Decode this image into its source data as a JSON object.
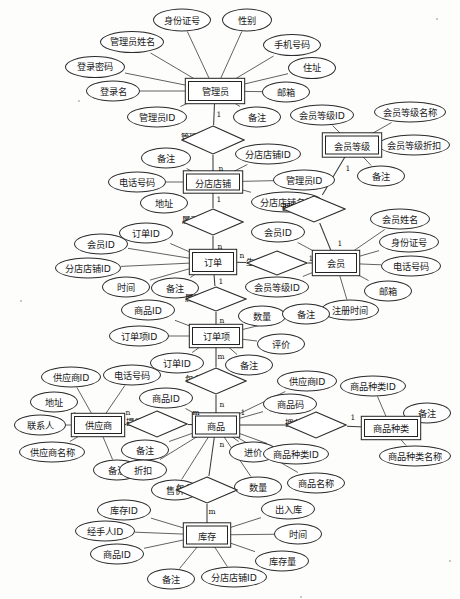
{
  "diagram": {
    "type": "entity-relationship",
    "style": {
      "stroke": "#2b2b2b",
      "fill": "#ffffff",
      "text": "#1a1a1a"
    }
  },
  "entities": [
    {
      "id": "admin",
      "label": "管理员",
      "x": 215,
      "y": 91,
      "w": 54,
      "h": 20
    },
    {
      "id": "branch",
      "label": "分店店铺",
      "x": 213,
      "y": 182,
      "w": 54,
      "h": 17
    },
    {
      "id": "level",
      "label": "会员等级",
      "x": 352,
      "y": 145,
      "w": 54,
      "h": 19
    },
    {
      "id": "order",
      "label": "订单",
      "x": 213,
      "y": 262,
      "w": 42,
      "h": 20
    },
    {
      "id": "member",
      "label": "会员",
      "x": 336,
      "y": 263,
      "w": 42,
      "h": 20
    },
    {
      "id": "orderitem",
      "label": "订单项",
      "x": 216,
      "y": 336,
      "w": 48,
      "h": 18
    },
    {
      "id": "supplier",
      "label": "供应商",
      "x": 98,
      "y": 425,
      "w": 48,
      "h": 18
    },
    {
      "id": "goods",
      "label": "商品",
      "x": 216,
      "y": 425,
      "w": 42,
      "h": 19
    },
    {
      "id": "category",
      "label": "商品种类",
      "x": 391,
      "y": 428,
      "w": 54,
      "h": 18
    },
    {
      "id": "stock",
      "label": "库存",
      "x": 207,
      "y": 535,
      "w": 42,
      "h": 19
    }
  ],
  "relationships": [
    {
      "id": "rel-manage",
      "label": "管理",
      "x": 213,
      "y": 140,
      "w": 64,
      "h": 30
    },
    {
      "id": "rel-belong-shop",
      "label": "属于",
      "x": 213,
      "y": 222,
      "w": 62,
      "h": 28
    },
    {
      "id": "rel-own-level",
      "label": "拥有",
      "x": 314,
      "y": 209,
      "w": 64,
      "h": 28
    },
    {
      "id": "rel-generate",
      "label": "生成",
      "x": 277,
      "y": 263,
      "w": 62,
      "h": 26
    },
    {
      "id": "rel-belong-order",
      "label": "属于",
      "x": 216,
      "y": 299,
      "w": 62,
      "h": 26
    },
    {
      "id": "rel-contain-item",
      "label": "包含",
      "x": 216,
      "y": 381,
      "w": 62,
      "h": 28
    },
    {
      "id": "rel-supply",
      "label": "提供",
      "x": 157,
      "y": 424,
      "w": 62,
      "h": 28
    },
    {
      "id": "rel-own-cat",
      "label": "拥有",
      "x": 316,
      "y": 425,
      "w": 62,
      "h": 28
    },
    {
      "id": "rel-contain-stk",
      "label": "包含",
      "x": 207,
      "y": 490,
      "w": 62,
      "h": 28
    }
  ],
  "attributes": [
    {
      "id": "a1",
      "label": "身份证号",
      "owner": "admin",
      "x": 182,
      "y": 20,
      "w": 58,
      "h": 23
    },
    {
      "id": "a2",
      "label": "性别",
      "owner": "admin",
      "x": 247,
      "y": 20,
      "w": 50,
      "h": 23
    },
    {
      "id": "a3",
      "label": "管理员姓名",
      "owner": "admin",
      "x": 132,
      "y": 42,
      "w": 64,
      "h": 22
    },
    {
      "id": "a4",
      "label": "手机号码",
      "owner": "admin",
      "x": 292,
      "y": 45,
      "w": 58,
      "h": 22
    },
    {
      "id": "a5",
      "label": "住址",
      "owner": "admin",
      "x": 312,
      "y": 68,
      "w": 48,
      "h": 22
    },
    {
      "id": "a6",
      "label": "登录密码",
      "owner": "admin",
      "x": 95,
      "y": 67,
      "w": 60,
      "h": 22
    },
    {
      "id": "a7",
      "label": "登录名",
      "owner": "admin",
      "x": 113,
      "y": 91,
      "w": 54,
      "h": 21
    },
    {
      "id": "a8",
      "label": "邮箱",
      "owner": "admin",
      "x": 286,
      "y": 92,
      "w": 48,
      "h": 21
    },
    {
      "id": "a9",
      "label": "管理员ID",
      "owner": "admin",
      "x": 157,
      "y": 117,
      "w": 60,
      "h": 21
    },
    {
      "id": "a10",
      "label": "备注",
      "owner": "admin",
      "x": 257,
      "y": 117,
      "w": 48,
      "h": 21
    },
    {
      "id": "a11",
      "label": "会员等级ID",
      "owner": "level",
      "x": 322,
      "y": 115,
      "w": 64,
      "h": 21
    },
    {
      "id": "a12",
      "label": "会员等级名称",
      "owner": "level",
      "x": 410,
      "y": 112,
      "w": 72,
      "h": 21
    },
    {
      "id": "a13",
      "label": "会员等级折扣",
      "owner": "level",
      "x": 414,
      "y": 145,
      "w": 72,
      "h": 21
    },
    {
      "id": "a14",
      "label": "备注",
      "owner": "level",
      "x": 381,
      "y": 176,
      "w": 48,
      "h": 21
    },
    {
      "id": "a15",
      "label": "备注",
      "owner": "branch",
      "x": 166,
      "y": 158,
      "w": 50,
      "h": 21
    },
    {
      "id": "a16",
      "label": "分店店铺ID",
      "owner": "branch",
      "x": 268,
      "y": 154,
      "w": 66,
      "h": 21
    },
    {
      "id": "a17",
      "label": "电话号码",
      "owner": "branch",
      "x": 137,
      "y": 182,
      "w": 58,
      "h": 21
    },
    {
      "id": "a18",
      "label": "管理员ID",
      "owner": "branch",
      "x": 304,
      "y": 180,
      "w": 62,
      "h": 21
    },
    {
      "id": "a19",
      "label": "地址",
      "owner": "branch",
      "x": 164,
      "y": 203,
      "w": 48,
      "h": 21
    },
    {
      "id": "a20",
      "label": "分店店铺名称",
      "owner": "branch",
      "x": 287,
      "y": 202,
      "w": 72,
      "h": 21
    },
    {
      "id": "a21",
      "label": "订单ID",
      "owner": "order",
      "x": 146,
      "y": 233,
      "w": 54,
      "h": 21
    },
    {
      "id": "a22",
      "label": "会员ID",
      "owner": "order",
      "x": 101,
      "y": 244,
      "w": 54,
      "h": 21
    },
    {
      "id": "a23",
      "label": "分店店铺ID",
      "owner": "order",
      "x": 88,
      "y": 268,
      "w": 66,
      "h": 21
    },
    {
      "id": "a24",
      "label": "时间",
      "owner": "order",
      "x": 126,
      "y": 287,
      "w": 48,
      "h": 21
    },
    {
      "id": "a25",
      "label": "备注",
      "owner": "order",
      "x": 175,
      "y": 288,
      "w": 48,
      "h": 21
    },
    {
      "id": "a26",
      "label": "会员ID",
      "owner": "member",
      "x": 278,
      "y": 232,
      "w": 54,
      "h": 21
    },
    {
      "id": "a27",
      "label": "会员等级ID",
      "owner": "member",
      "x": 277,
      "y": 287,
      "w": 64,
      "h": 21
    },
    {
      "id": "a28",
      "label": "会员姓名",
      "owner": "member",
      "x": 400,
      "y": 219,
      "w": 60,
      "h": 21
    },
    {
      "id": "a29",
      "label": "身份证号",
      "owner": "member",
      "x": 409,
      "y": 242,
      "w": 60,
      "h": 21
    },
    {
      "id": "a30",
      "label": "电话号码",
      "owner": "member",
      "x": 411,
      "y": 266,
      "w": 60,
      "h": 21
    },
    {
      "id": "a31",
      "label": "邮箱",
      "owner": "member",
      "x": 388,
      "y": 291,
      "w": 48,
      "h": 21
    },
    {
      "id": "a32",
      "label": "注册时间",
      "owner": "member",
      "x": 350,
      "y": 310,
      "w": 58,
      "h": 21
    },
    {
      "id": "a33",
      "label": "商品ID",
      "owner": "orderitem",
      "x": 148,
      "y": 310,
      "w": 54,
      "h": 21
    },
    {
      "id": "a34",
      "label": "订单项ID",
      "owner": "orderitem",
      "x": 139,
      "y": 336,
      "w": 60,
      "h": 21
    },
    {
      "id": "a35",
      "label": "数量",
      "owner": "orderitem",
      "x": 262,
      "y": 316,
      "w": 48,
      "h": 21
    },
    {
      "id": "a36",
      "label": "备注",
      "owner": "orderitem",
      "x": 306,
      "y": 314,
      "w": 48,
      "h": 21
    },
    {
      "id": "a37",
      "label": "评价",
      "owner": "orderitem",
      "x": 281,
      "y": 344,
      "w": 48,
      "h": 21
    },
    {
      "id": "a38",
      "label": "订单ID",
      "owner": "orderitem",
      "x": 177,
      "y": 363,
      "w": 54,
      "h": 21
    },
    {
      "id": "a39",
      "label": "备注",
      "owner": "orderitem",
      "x": 249,
      "y": 365,
      "w": 48,
      "h": 21
    },
    {
      "id": "a40",
      "label": "供应商ID",
      "owner": "supplier",
      "x": 71,
      "y": 377,
      "w": 60,
      "h": 21
    },
    {
      "id": "a41",
      "label": "电话号码",
      "owner": "supplier",
      "x": 132,
      "y": 375,
      "w": 58,
      "h": 21
    },
    {
      "id": "a42",
      "label": "地址",
      "owner": "supplier",
      "x": 54,
      "y": 402,
      "w": 48,
      "h": 21
    },
    {
      "id": "a43",
      "label": "联系人",
      "owner": "supplier",
      "x": 40,
      "y": 425,
      "w": 52,
      "h": 21
    },
    {
      "id": "a44",
      "label": "供应商名称",
      "owner": "supplier",
      "x": 52,
      "y": 452,
      "w": 66,
      "h": 21
    },
    {
      "id": "a45",
      "label": "备注",
      "owner": "supplier",
      "x": 117,
      "y": 470,
      "w": 48,
      "h": 21
    },
    {
      "id": "a46",
      "label": "商品ID",
      "owner": "goods",
      "x": 166,
      "y": 398,
      "w": 54,
      "h": 21
    },
    {
      "id": "a47",
      "label": "供应商ID",
      "owner": "goods",
      "x": 307,
      "y": 381,
      "w": 60,
      "h": 21
    },
    {
      "id": "a48",
      "label": "商品码",
      "owner": "goods",
      "x": 290,
      "y": 404,
      "w": 54,
      "h": 21
    },
    {
      "id": "a49",
      "label": "备注",
      "owner": "goods",
      "x": 145,
      "y": 450,
      "w": 48,
      "h": 21
    },
    {
      "id": "a50",
      "label": "折扣",
      "owner": "goods",
      "x": 143,
      "y": 470,
      "w": 48,
      "h": 21
    },
    {
      "id": "a51",
      "label": "进价",
      "owner": "goods",
      "x": 253,
      "y": 452,
      "w": 48,
      "h": 21
    },
    {
      "id": "a52",
      "label": "数量",
      "owner": "goods",
      "x": 258,
      "y": 487,
      "w": 48,
      "h": 21
    },
    {
      "id": "a53",
      "label": "商品名称",
      "owner": "goods",
      "x": 316,
      "y": 483,
      "w": 58,
      "h": 21
    },
    {
      "id": "a54",
      "label": "商品种类ID",
      "owner": "goods",
      "x": 296,
      "y": 454,
      "w": 66,
      "h": 21
    },
    {
      "id": "a55",
      "label": "售价",
      "owner": "goods",
      "x": 175,
      "y": 490,
      "w": 48,
      "h": 21
    },
    {
      "id": "a56",
      "label": "商品种类ID",
      "owner": "category",
      "x": 373,
      "y": 386,
      "w": 66,
      "h": 21
    },
    {
      "id": "a57",
      "label": "备注",
      "owner": "category",
      "x": 427,
      "y": 413,
      "w": 48,
      "h": 21
    },
    {
      "id": "a58",
      "label": "商品种类名称",
      "owner": "category",
      "x": 415,
      "y": 456,
      "w": 72,
      "h": 21
    },
    {
      "id": "a59",
      "label": "库存ID",
      "owner": "stock",
      "x": 124,
      "y": 510,
      "w": 54,
      "h": 21
    },
    {
      "id": "a60",
      "label": "经手人ID",
      "owner": "stock",
      "x": 105,
      "y": 531,
      "w": 60,
      "h": 21
    },
    {
      "id": "a61",
      "label": "商品ID",
      "owner": "stock",
      "x": 117,
      "y": 554,
      "w": 54,
      "h": 21
    },
    {
      "id": "a62",
      "label": "出入库",
      "owner": "stock",
      "x": 288,
      "y": 509,
      "w": 54,
      "h": 21
    },
    {
      "id": "a63",
      "label": "时间",
      "owner": "stock",
      "x": 298,
      "y": 534,
      "w": 48,
      "h": 21
    },
    {
      "id": "a64",
      "label": "库存量",
      "owner": "stock",
      "x": 282,
      "y": 561,
      "w": 54,
      "h": 21
    },
    {
      "id": "a65",
      "label": "备注",
      "owner": "stock",
      "x": 171,
      "y": 579,
      "w": 48,
      "h": 21
    },
    {
      "id": "a66",
      "label": "分店店铺ID",
      "owner": "stock",
      "x": 234,
      "y": 577,
      "w": 66,
      "h": 21
    }
  ],
  "cardinalities": [
    {
      "id": "c1",
      "label": "1",
      "x": 219,
      "y": 114
    },
    {
      "id": "c2",
      "label": "n",
      "x": 221,
      "y": 168
    },
    {
      "id": "c3",
      "label": "1",
      "x": 219,
      "y": 199
    },
    {
      "id": "c4",
      "label": "n",
      "x": 220,
      "y": 246
    },
    {
      "id": "c5",
      "label": "1",
      "x": 348,
      "y": 168
    },
    {
      "id": "c6",
      "label": "1",
      "x": 340,
      "y": 243
    },
    {
      "id": "c7",
      "label": "n",
      "x": 242,
      "y": 255
    },
    {
      "id": "c8",
      "label": "1",
      "x": 311,
      "y": 258
    },
    {
      "id": "c9",
      "label": "1",
      "x": 221,
      "y": 281
    },
    {
      "id": "c10",
      "label": "n",
      "x": 222,
      "y": 320
    },
    {
      "id": "c11",
      "label": "m",
      "x": 221,
      "y": 356
    },
    {
      "id": "c12",
      "label": "n",
      "x": 222,
      "y": 404
    },
    {
      "id": "c13",
      "label": "n",
      "x": 128,
      "y": 412
    },
    {
      "id": "c14",
      "label": "m",
      "x": 196,
      "y": 412
    },
    {
      "id": "c15",
      "label": "n",
      "x": 222,
      "y": 444
    },
    {
      "id": "c16",
      "label": "1",
      "x": 243,
      "y": 412
    },
    {
      "id": "c17",
      "label": "1",
      "x": 353,
      "y": 417
    },
    {
      "id": "c18",
      "label": "m",
      "x": 212,
      "y": 511
    }
  ]
}
